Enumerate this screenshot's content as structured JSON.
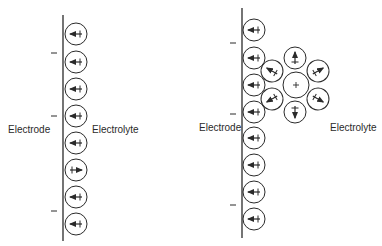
{
  "left_panel": {
    "electrode_label": "Electrode",
    "electrolyte_label": "Electrolyte",
    "charge_symbol": "−",
    "dipoles": [
      "pointing-to-electrode",
      "pointing-to-electrode",
      "pointing-to-electrode",
      "pointing-to-electrode",
      "pointing-to-electrode",
      "pointing-away",
      "pointing-to-electrode",
      "pointing-to-electrode"
    ]
  },
  "right_panel": {
    "electrode_label": "Electrode",
    "electrolyte_label": "Electrolyte",
    "charge_symbol": "−",
    "central_ion_label": "+",
    "solvation_shell_count": 6
  },
  "colors": {
    "line": "#2a2a2a",
    "background": "#ffffff"
  }
}
